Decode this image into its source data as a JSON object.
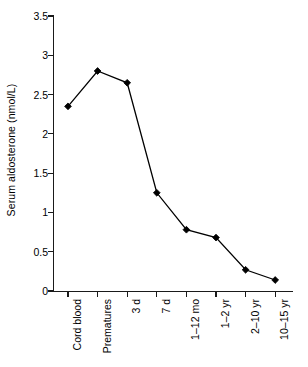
{
  "chart_data": {
    "type": "line",
    "title": "",
    "xlabel": "",
    "ylabel": "Serum aldosterone (nmol/L)",
    "categories": [
      "Cord blood",
      "Prematures",
      "3 d",
      "7 d",
      "1–12 mo",
      "1–2 yr",
      "2–10 yr",
      "10–15 yr"
    ],
    "values": [
      2.35,
      2.8,
      2.65,
      1.25,
      0.78,
      0.68,
      0.27,
      0.14
    ],
    "series": [
      {
        "name": "Serum aldosterone",
        "values": [
          2.35,
          2.8,
          2.65,
          1.25,
          0.78,
          0.68,
          0.27,
          0.14
        ]
      }
    ],
    "ylim": [
      0,
      3.5
    ],
    "yticks": [
      0,
      0.5,
      1,
      1.5,
      2,
      2.5,
      3,
      3.5
    ],
    "ytick_labels": [
      "0",
      "0.5",
      "1",
      "1.5",
      "2",
      "2.5",
      "3",
      "3.5"
    ],
    "grid": false,
    "legend": false,
    "legend_position": "none",
    "marker": "diamond",
    "marker_color": "#000000",
    "line_color": "#000000",
    "background_color": "#ffffff"
  }
}
